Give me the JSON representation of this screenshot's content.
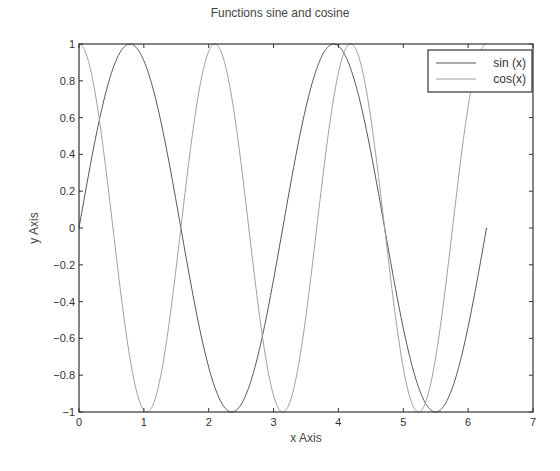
{
  "chart_data": {
    "type": "line",
    "title": "Functions sine and cosine",
    "xlabel": "x Axis",
    "ylabel": "y Axis",
    "xlim": [
      0,
      7
    ],
    "ylim": [
      -1,
      1
    ],
    "xticks": [
      "0",
      "1",
      "2",
      "3",
      "4",
      "5",
      "6",
      "7"
    ],
    "yticks": [
      "-1",
      "-0.8",
      "-0.6",
      "-0.4",
      "-0.2",
      "0",
      "0.2",
      "0.4",
      "0.6",
      "0.8",
      "1"
    ],
    "grid": false,
    "legend_position": "upper right",
    "series": [
      {
        "name": "sin (x)",
        "function": "sin(2x)",
        "x_range": [
          0,
          6.2832
        ],
        "color": "#555555",
        "x": [
          0,
          0.785,
          1.571,
          2.356,
          3.142,
          3.927,
          4.712,
          5.498,
          6.283
        ],
        "y": [
          0,
          1,
          0,
          -1,
          0,
          1,
          0,
          -1,
          0
        ]
      },
      {
        "name": "cos(x)",
        "function": "cos(3x)",
        "x_range": [
          0,
          6.2832
        ],
        "color": "#a0a0a0",
        "x": [
          0,
          0.524,
          1.047,
          1.571,
          2.094,
          2.618,
          3.142,
          3.665,
          4.189,
          4.712,
          5.236,
          5.76,
          6.283
        ],
        "y": [
          1,
          0,
          -1,
          0,
          1,
          0,
          -1,
          0,
          1,
          0,
          -1,
          0,
          1
        ]
      }
    ]
  },
  "legend": {
    "items": [
      {
        "label": "sin (x)",
        "color": "#555555"
      },
      {
        "label": "cos(x)",
        "color": "#a0a0a0"
      }
    ]
  }
}
